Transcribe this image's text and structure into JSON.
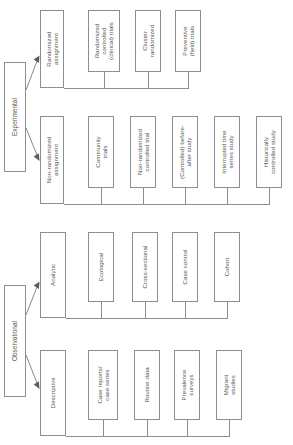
{
  "diagram": {
    "orientation": "rotated-90-ccw",
    "line_color": "#8e8e8e",
    "text_color": "#595959",
    "background": "#ffffff",
    "roots": [
      {
        "id": "experimental",
        "label": "Experimental",
        "branches": [
          {
            "id": "randomized-assignment",
            "label": "Randomized\nassignment",
            "children": [
              {
                "id": "randomized-controlled-clinical-trials",
                "label": "Randomized\ncontrolled\n(clinical) trials"
              },
              {
                "id": "cluster-randomized",
                "label": "Cluster\nrandomized"
              },
              {
                "id": "preventive-field-trials",
                "label": "Preventive\n(field) trials"
              }
            ]
          },
          {
            "id": "non-randomized-assignment",
            "label": "Non-randomized\nassignment",
            "children": [
              {
                "id": "community-trials",
                "label": "Community\ntrials"
              },
              {
                "id": "non-randomized-controlled-trial",
                "label": "Non-randomized\ncontrolled trial"
              },
              {
                "id": "controlled-before-after-study",
                "label": "(Controlled) before-\nafter study"
              },
              {
                "id": "interrupted-time-series-study",
                "label": "Interrupted time\nseries study"
              },
              {
                "id": "historically-controlled-study",
                "label": "Historically\ncontrolled study"
              }
            ]
          }
        ]
      },
      {
        "id": "observational",
        "label": "Observational",
        "branches": [
          {
            "id": "analytic",
            "label": "Analytic",
            "children": [
              {
                "id": "ecological",
                "label": "Ecological"
              },
              {
                "id": "cross-sectional",
                "label": "Cross-sectional"
              },
              {
                "id": "case-control",
                "label": "Case control"
              },
              {
                "id": "cohort",
                "label": "Cohort"
              }
            ]
          },
          {
            "id": "descriptive",
            "label": "Descriptive",
            "children": [
              {
                "id": "case-reports-case-series",
                "label": "Case reports/\ncase series"
              },
              {
                "id": "routine-data",
                "label": "Routine data"
              },
              {
                "id": "prevalence-surveys",
                "label": "Prevalence\nsurveys"
              },
              {
                "id": "migrant-studies",
                "label": "Migrant\nstudies"
              }
            ]
          }
        ]
      }
    ]
  }
}
